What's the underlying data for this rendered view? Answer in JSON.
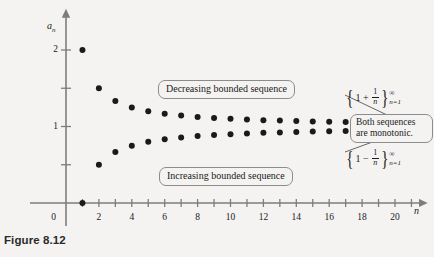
{
  "figure": {
    "caption": "Figure 8.12",
    "background_color": "#f4f3f1",
    "ink_color": "#1a1a1a"
  },
  "axes": {
    "y_axis_label": "a",
    "y_axis_label_sub": "n",
    "x_axis_label": "n",
    "origin_label": "0",
    "y_tick_labels": [
      "1",
      "2"
    ],
    "y_tick_values": [
      1,
      2
    ],
    "y_minor_ticks": [
      0.5,
      1.5
    ],
    "x_tick_labels": [
      "2",
      "4",
      "6",
      "8",
      "10",
      "12",
      "14",
      "16",
      "18",
      "20"
    ],
    "x_tick_values": [
      2,
      4,
      6,
      8,
      10,
      12,
      14,
      16,
      18,
      20
    ]
  },
  "callouts": {
    "decreasing": "Decreasing bounded sequence",
    "increasing": "Increasing bounded sequence",
    "monotonic": "Both sequences are monotonic."
  },
  "formulas": {
    "upper": {
      "brace_open": "{",
      "lead": "1 +",
      "numerator": "1",
      "denominator": "n",
      "brace_close": "}",
      "superscript": "∞",
      "subscript_var": "n",
      "subscript_eq": "=1"
    },
    "lower": {
      "brace_open": "{",
      "lead": "1 −",
      "numerator": "1",
      "denominator": "n",
      "brace_close": "}",
      "superscript": "∞",
      "subscript_var": "n",
      "subscript_eq": "=1"
    }
  },
  "chart_data": {
    "type": "scatter",
    "title": "",
    "xlabel": "n",
    "ylabel": "a_n",
    "xlim": [
      0,
      21.5
    ],
    "ylim": [
      0,
      2.25
    ],
    "grid": false,
    "legend": "none",
    "annotations": [
      "Decreasing bounded sequence",
      "Increasing bounded sequence",
      "Both sequences are monotonic."
    ],
    "x": [
      1,
      2,
      3,
      4,
      5,
      6,
      7,
      8,
      9,
      10,
      11,
      12,
      13,
      14,
      15,
      16,
      17,
      18,
      19,
      20
    ],
    "series": [
      {
        "name": "{1 + 1/n}",
        "label": "Decreasing bounded sequence",
        "values": [
          2,
          1.5,
          1.3333,
          1.25,
          1.2,
          1.1667,
          1.1429,
          1.125,
          1.1111,
          1.1,
          1.0909,
          1.0833,
          1.0769,
          1.0714,
          1.0667,
          1.0625,
          1.0588,
          1.0556,
          1.0526,
          1.05
        ]
      },
      {
        "name": "{1 - 1/n}",
        "label": "Increasing bounded sequence",
        "values": [
          0,
          0.5,
          0.6667,
          0.75,
          0.8,
          0.8333,
          0.8571,
          0.875,
          0.8889,
          0.9,
          0.9091,
          0.9167,
          0.9231,
          0.9286,
          0.9333,
          0.9375,
          0.9412,
          0.9444,
          0.9474,
          0.95
        ]
      }
    ]
  }
}
